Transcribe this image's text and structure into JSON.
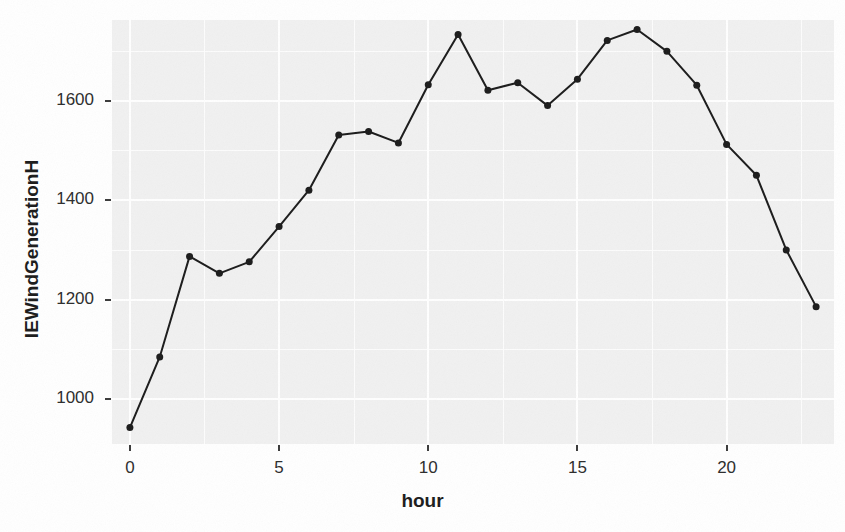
{
  "figure": {
    "top_note": "",
    "background_color": "#ffffff",
    "panel_color": "#f1f1f1",
    "grid_color": "#ffffff",
    "ink_color": "#1a1a1a"
  },
  "axes": {
    "x_title": "hour",
    "y_title": "IEWindGenerationH",
    "x_ticks": [
      "0",
      "5",
      "10",
      "15",
      "20"
    ],
    "y_ticks": [
      "1000",
      "1200",
      "1400",
      "1600"
    ]
  },
  "chart_data": {
    "type": "line",
    "title": "",
    "subtitle": "",
    "xlabel": "hour",
    "ylabel": "IEWindGenerationH",
    "x": [
      0,
      1,
      2,
      3,
      4,
      5,
      6,
      7,
      8,
      9,
      10,
      11,
      12,
      13,
      14,
      15,
      16,
      17,
      18,
      19,
      20,
      21,
      22,
      23
    ],
    "values": [
      943,
      1085,
      1287,
      1253,
      1276,
      1347,
      1420,
      1531,
      1538,
      1515,
      1632,
      1733,
      1621,
      1636,
      1590,
      1643,
      1721,
      1743,
      1699,
      1631,
      1512,
      1450,
      1300,
      1186
    ],
    "series": [
      {
        "name": "IEWindGenerationH",
        "values": [
          943,
          1085,
          1287,
          1253,
          1276,
          1347,
          1420,
          1531,
          1538,
          1515,
          1632,
          1733,
          1621,
          1636,
          1590,
          1643,
          1721,
          1743,
          1699,
          1631,
          1512,
          1450,
          1300,
          1186
        ]
      }
    ],
    "xlim": [
      -0.6,
      23.6
    ],
    "ylim": [
      910,
      1762
    ],
    "x_ticks": [
      0,
      5,
      10,
      15,
      20
    ],
    "y_ticks": [
      1000,
      1200,
      1400,
      1600
    ],
    "y_minor_ticks": [
      900,
      1100,
      1300,
      1500,
      1700
    ],
    "x_minor_ticks": [
      2.5,
      7.5,
      12.5,
      17.5,
      22.5
    ],
    "grid": true,
    "legend": "none",
    "marker": "filled-circle",
    "marker_size": 7,
    "line_width": 2,
    "color": "#1a1a1a"
  }
}
